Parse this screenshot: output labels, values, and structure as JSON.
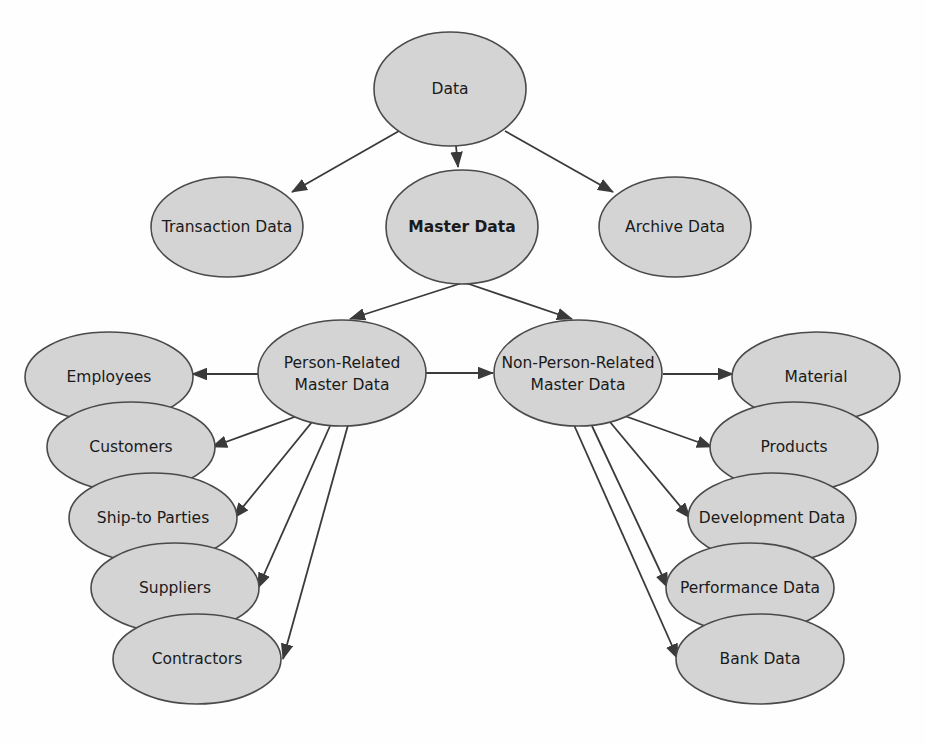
{
  "diagram": {
    "type": "tree-diagram",
    "colors": {
      "node_fill": "#d4d4d4",
      "node_stroke": "#4a4a4a",
      "edge": "#3a3a3a",
      "text": "#1a1a1a",
      "background": "#fefefe"
    },
    "nodes": [
      {
        "id": "data",
        "label": "Data",
        "line1": "Data",
        "line2": "",
        "bold": false,
        "cx": 450,
        "cy": 89,
        "rx": 76,
        "ry": 57
      },
      {
        "id": "transaction",
        "label": "Transaction Data",
        "line1": "Transaction Data",
        "line2": "",
        "bold": false,
        "cx": 227,
        "cy": 227,
        "rx": 76,
        "ry": 50
      },
      {
        "id": "master",
        "label": "Master Data",
        "line1": "Master Data",
        "line2": "",
        "bold": true,
        "cx": 462,
        "cy": 227,
        "rx": 76,
        "ry": 57
      },
      {
        "id": "archive",
        "label": "Archive Data",
        "line1": "Archive Data",
        "line2": "",
        "bold": false,
        "cx": 675,
        "cy": 227,
        "rx": 76,
        "ry": 50
      },
      {
        "id": "person",
        "label": "Person-Related Master Data",
        "line1": "Person-Related",
        "line2": "Master Data",
        "bold": false,
        "cx": 342,
        "cy": 373,
        "rx": 84,
        "ry": 53
      },
      {
        "id": "nonperson",
        "label": "Non-Person-Related Master Data",
        "line1": "Non-Person-Related",
        "line2": "Master Data",
        "bold": false,
        "cx": 578,
        "cy": 373,
        "rx": 84,
        "ry": 53
      },
      {
        "id": "employees",
        "label": "Employees",
        "line1": "Employees",
        "line2": "",
        "bold": false,
        "cx": 109,
        "cy": 377,
        "rx": 84,
        "ry": 45
      },
      {
        "id": "customers",
        "label": "Customers",
        "line1": "Customers",
        "line2": "",
        "bold": false,
        "cx": 131,
        "cy": 447,
        "rx": 84,
        "ry": 45
      },
      {
        "id": "shipto",
        "label": "Ship-to Parties",
        "line1": "Ship-to Parties",
        "line2": "",
        "bold": false,
        "cx": 153,
        "cy": 518,
        "rx": 84,
        "ry": 45
      },
      {
        "id": "suppliers",
        "label": "Suppliers",
        "line1": "Suppliers",
        "line2": "",
        "bold": false,
        "cx": 175,
        "cy": 588,
        "rx": 84,
        "ry": 45
      },
      {
        "id": "contractors",
        "label": "Contractors",
        "line1": "Contractors",
        "line2": "",
        "bold": false,
        "cx": 197,
        "cy": 659,
        "rx": 84,
        "ry": 45
      },
      {
        "id": "material",
        "label": "Material",
        "line1": "Material",
        "line2": "",
        "bold": false,
        "cx": 816,
        "cy": 377,
        "rx": 84,
        "ry": 45
      },
      {
        "id": "products",
        "label": "Products",
        "line1": "Products",
        "line2": "",
        "bold": false,
        "cx": 794,
        "cy": 447,
        "rx": 84,
        "ry": 45
      },
      {
        "id": "development",
        "label": "Development Data",
        "line1": "Development Data",
        "line2": "",
        "bold": false,
        "cx": 772,
        "cy": 518,
        "rx": 84,
        "ry": 45
      },
      {
        "id": "performance",
        "label": "Performance Data",
        "line1": "Performance Data",
        "line2": "",
        "bold": false,
        "cx": 750,
        "cy": 588,
        "rx": 84,
        "ry": 45
      },
      {
        "id": "bank",
        "label": "Bank Data",
        "line1": "Bank Data",
        "line2": "",
        "bold": false,
        "cx": 760,
        "cy": 659,
        "rx": 84,
        "ry": 45
      }
    ],
    "edges": [
      {
        "id": "e-data-transaction",
        "from": "data",
        "to": "transaction",
        "x1": 399,
        "y1": 131,
        "x2": 292,
        "y2": 192
      },
      {
        "id": "e-data-master",
        "from": "data",
        "to": "master",
        "x1": 456,
        "y1": 146,
        "x2": 458,
        "y2": 167
      },
      {
        "id": "e-data-archive",
        "from": "data",
        "to": "archive",
        "x1": 505,
        "y1": 131,
        "x2": 613,
        "y2": 192
      },
      {
        "id": "e-master-person",
        "from": "master",
        "to": "person",
        "x1": 462,
        "y1": 283,
        "x2": 350,
        "y2": 319
      },
      {
        "id": "e-master-nonperson",
        "from": "master",
        "to": "nonperson",
        "x1": 466,
        "y1": 283,
        "x2": 572,
        "y2": 319
      },
      {
        "id": "e-person-nonperson",
        "from": "person",
        "to": "nonperson",
        "x1": 426,
        "y1": 373,
        "x2": 493,
        "y2": 373
      },
      {
        "id": "e-person-employees",
        "from": "person",
        "to": "employees",
        "x1": 258,
        "y1": 374,
        "x2": 192,
        "y2": 374
      },
      {
        "id": "e-person-customers",
        "from": "person",
        "to": "customers",
        "x1": 300,
        "y1": 415,
        "x2": 212,
        "y2": 447
      },
      {
        "id": "e-person-shipto",
        "from": "person",
        "to": "shipto",
        "x1": 312,
        "y1": 422,
        "x2": 234,
        "y2": 518
      },
      {
        "id": "e-person-suppliers",
        "from": "person",
        "to": "suppliers",
        "x1": 330,
        "y1": 426,
        "x2": 258,
        "y2": 588
      },
      {
        "id": "e-person-contractors",
        "from": "person",
        "to": "contractors",
        "x1": 348,
        "y1": 425,
        "x2": 283,
        "y2": 659
      },
      {
        "id": "e-nonperson-material",
        "from": "nonperson",
        "to": "material",
        "x1": 663,
        "y1": 374,
        "x2": 733,
        "y2": 374
      },
      {
        "id": "e-nonperson-products",
        "from": "nonperson",
        "to": "products",
        "x1": 622,
        "y1": 415,
        "x2": 712,
        "y2": 447
      },
      {
        "id": "e-nonperson-development",
        "from": "nonperson",
        "to": "development",
        "x1": 610,
        "y1": 422,
        "x2": 690,
        "y2": 518
      },
      {
        "id": "e-nonperson-performance",
        "from": "nonperson",
        "to": "performance",
        "x1": 592,
        "y1": 426,
        "x2": 668,
        "y2": 588
      },
      {
        "id": "e-nonperson-bank",
        "from": "nonperson",
        "to": "bank",
        "x1": 574,
        "y1": 425,
        "x2": 678,
        "y2": 659
      }
    ]
  }
}
